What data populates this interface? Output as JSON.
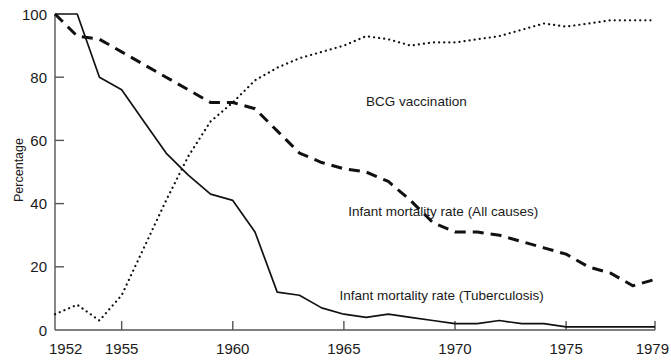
{
  "chart_data": {
    "type": "line",
    "title": "",
    "xlabel": "",
    "ylabel": "Percentage",
    "xlim": [
      1952,
      1979
    ],
    "ylim": [
      0,
      100
    ],
    "grid": false,
    "legend_position": "inline-annotations",
    "x_ticks": [
      1952,
      1955,
      1960,
      1965,
      1970,
      1975,
      1979
    ],
    "x_tick_labels": [
      "1952",
      "1955",
      "1960",
      "1965",
      "1970",
      "1975",
      "1979"
    ],
    "y_ticks": [
      0,
      20,
      40,
      60,
      80,
      100
    ],
    "y_tick_labels": [
      "0",
      "20",
      "40",
      "60",
      "80",
      "100"
    ],
    "x": [
      1952,
      1953,
      1954,
      1955,
      1956,
      1957,
      1958,
      1959,
      1960,
      1961,
      1962,
      1963,
      1964,
      1965,
      1966,
      1967,
      1968,
      1969,
      1970,
      1971,
      1972,
      1973,
      1974,
      1975,
      1976,
      1977,
      1978,
      1979
    ],
    "series": [
      {
        "name": "BCG vaccination",
        "style": "dotted",
        "color": "#111111",
        "label_x": 1966.0,
        "label_y": 71.0,
        "values": [
          5,
          8,
          3,
          11,
          26,
          41,
          55,
          66,
          72,
          79,
          83,
          86,
          88,
          90,
          93,
          92,
          90,
          91,
          91,
          92,
          93,
          95,
          97,
          96,
          97,
          98,
          98,
          98
        ]
      },
      {
        "name": "Infant mortality rate (All causes)",
        "style": "dashed",
        "color": "#111111",
        "label_x": 1965.2,
        "label_y": 36.0,
        "values": [
          100,
          93,
          92,
          88,
          84,
          80,
          76,
          72,
          72,
          70,
          63,
          56,
          53,
          51,
          50,
          47,
          41,
          34,
          31,
          31,
          30,
          28,
          26,
          24,
          22,
          21,
          20,
          20
        ]
      },
      {
        "name": "Infant mortality rate (Tuberculosis)",
        "style": "solid",
        "color": "#111111",
        "label_x": 1964.8,
        "label_y": 9.5,
        "values": [
          100,
          100,
          80,
          76,
          66,
          56,
          49,
          43,
          41,
          31,
          12,
          11,
          7,
          5,
          4,
          5,
          4,
          3,
          2,
          2,
          3,
          2,
          2,
          1,
          1,
          1,
          1,
          1
        ]
      }
    ],
    "series_tail": [
      {
        "name": "Infant mortality rate (All causes)",
        "tail_x": [
          1976,
          1977,
          1978,
          1979
        ],
        "tail_values": [
          20,
          18,
          14,
          16
        ]
      }
    ]
  },
  "figure": {
    "background_color": "#ffffff",
    "ink_color": "#111111",
    "axis_color": "#555555"
  }
}
